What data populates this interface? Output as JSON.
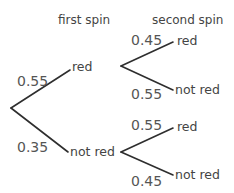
{
  "headers": {
    "first": "first spin",
    "second": "second spin"
  },
  "first_spin": {
    "red": {
      "label": "red",
      "probability": "0.55"
    },
    "not_red": {
      "label": "not red",
      "probability": "0.35"
    }
  },
  "second_spin": {
    "after_red": {
      "red": {
        "label": "red",
        "probability": "0.45"
      },
      "not_red": {
        "label": "not red",
        "probability": "0.55"
      }
    },
    "after_not_red": {
      "red": {
        "label": "red",
        "probability": "0.55"
      },
      "not_red": {
        "label": "not red",
        "probability": "0.45"
      }
    }
  },
  "colors": {
    "line": "#2e2e2e",
    "text": "#444444"
  }
}
